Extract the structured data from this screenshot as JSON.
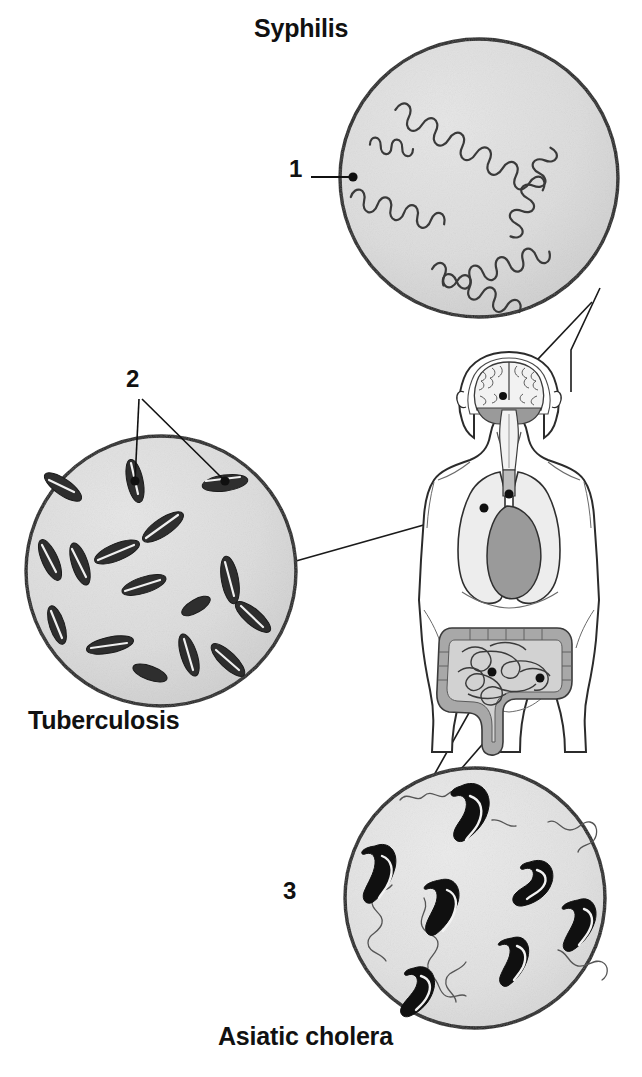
{
  "figure": {
    "title_visible": false,
    "background_color": "#ffffff",
    "width": 642,
    "height": 1077
  },
  "palette": {
    "disc_fill": "#dcdcdc",
    "disc_stroke": "#1a1a1a",
    "bacteria_dark": "#1a1a1a",
    "bacteria_rod": "#2e2e2e",
    "body_outline": "#2b2b2b",
    "body_fill": "#ffffff",
    "organ_gray": "#9a9a9a",
    "organ_light": "#ededed",
    "leader_line": "#1a1a1a",
    "text_color": "#111111"
  },
  "captions": {
    "syphilis": "Syphilis",
    "tuberculosis": "Tuberculosis",
    "cholera": "Asiatic cholera"
  },
  "callouts": [
    {
      "number": "1",
      "label": "1",
      "belongs_to": "syphilis",
      "points_to": "spirochete",
      "leader_lines": 1,
      "x": 289,
      "y": 155
    },
    {
      "number": "2",
      "label": "2",
      "belongs_to": "tuberculosis",
      "points_to": "bacillus",
      "leader_lines": 2,
      "x": 126,
      "y": 365
    },
    {
      "number": "3",
      "label": "3",
      "belongs_to": "cholera",
      "points_to": "vibrio",
      "leader_lines": 0,
      "x": 283,
      "y": 877
    }
  ],
  "discs": [
    {
      "name": "syphilis-disc",
      "caption": "Syphilis",
      "cx": 479,
      "cy": 178,
      "r": 139,
      "organism": "spirochete",
      "organism_style": "corkscrew-outline",
      "organism_count": 5,
      "fill": "#dcdcdc"
    },
    {
      "name": "tuberculosis-disc",
      "caption": "Tuberculosis",
      "cx": 161,
      "cy": 571,
      "r": 135,
      "organism": "bacillus",
      "organism_style": "rod-solid-dark",
      "organism_count": 16,
      "fill": "#dcdcdc"
    },
    {
      "name": "cholera-disc",
      "caption": "Asiatic cholera",
      "cx": 475,
      "cy": 898,
      "r": 130,
      "organism": "vibrio",
      "organism_style": "comma-with-flagellum",
      "organism_count": 8,
      "fill": "#e2e2e2"
    }
  ],
  "body_figure": {
    "name": "human-torso",
    "organs": [
      {
        "name": "brain",
        "target_of": "syphilis"
      },
      {
        "name": "brainstem",
        "target_of": "syphilis"
      },
      {
        "name": "lungs",
        "target_of": "tuberculosis"
      },
      {
        "name": "heart",
        "target_of": "none"
      },
      {
        "name": "large-intestine",
        "target_of": "cholera"
      },
      {
        "name": "small-intestine",
        "target_of": "cholera"
      }
    ],
    "bounds": {
      "x": 420,
      "y": 352,
      "w": 175,
      "h": 400
    }
  },
  "connectors": [
    {
      "name": "syphilis-to-brain",
      "from": "syphilis-disc",
      "to": "brain",
      "lines": 2
    },
    {
      "name": "tuberculosis-to-lung",
      "from": "tuberculosis-disc",
      "to": "lungs",
      "lines": 1
    },
    {
      "name": "cholera-to-intestine",
      "from": "cholera-disc",
      "to": "intestine",
      "lines": 2
    }
  ]
}
